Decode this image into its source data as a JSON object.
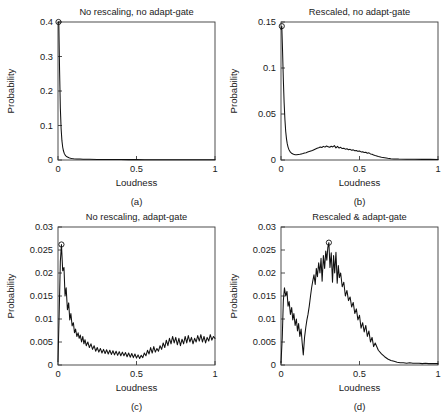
{
  "figure": {
    "width": 447,
    "height": 413,
    "background": "#ffffff",
    "line_color": "#111111",
    "axis_color": "#3b3b3b"
  },
  "panels": [
    {
      "id": "a",
      "caption": "(a)",
      "title": "No rescaling, no adapt-gate",
      "xlabel": "Loudness",
      "ylabel": "Probability",
      "xticks": [
        0,
        0.5,
        1
      ],
      "xticklabels": [
        "0",
        "0.5",
        "1"
      ],
      "yticks": [
        0,
        0.1,
        0.2,
        0.3,
        0.4
      ],
      "yticklabels": [
        "0",
        "0.1",
        "0.2",
        "0.3",
        "0.4"
      ],
      "xlim": [
        0,
        1
      ],
      "ylim": [
        0,
        0.4
      ],
      "peak_marker": {
        "x": 0.003,
        "y": 0.4
      }
    },
    {
      "id": "b",
      "caption": "(b)",
      "title": "Rescaled, no adapt-gate",
      "xlabel": "Loudness",
      "ylabel": "Probability",
      "xticks": [
        0,
        0.5,
        1
      ],
      "xticklabels": [
        "0",
        "0.5",
        "1"
      ],
      "yticks": [
        0,
        0.05,
        0.1,
        0.15
      ],
      "yticklabels": [
        "0",
        "0.05",
        "0.1",
        "0.15"
      ],
      "xlim": [
        0,
        1
      ],
      "ylim": [
        0,
        0.15
      ],
      "peak_marker": {
        "x": 0.005,
        "y": 0.1455
      }
    },
    {
      "id": "c",
      "caption": "(c)",
      "title": "No rescaling, adapt-gate",
      "xlabel": "Loudness",
      "ylabel": "Probability",
      "xticks": [
        0,
        0.5,
        1
      ],
      "xticklabels": [
        "0",
        "0.5",
        "1"
      ],
      "yticks": [
        0,
        0.005,
        0.01,
        0.015,
        0.02,
        0.025,
        0.03
      ],
      "yticklabels": [
        "0",
        "0.005",
        "0.01",
        "0.015",
        "0.02",
        "0.025",
        "0.03"
      ],
      "xlim": [
        0,
        1
      ],
      "ylim": [
        0,
        0.03
      ],
      "peak_marker": {
        "x": 0.022,
        "y": 0.0262
      }
    },
    {
      "id": "d",
      "caption": "(d)",
      "title": "Rescaled & adapt-gate",
      "xlabel": "Loudness",
      "ylabel": "Probability",
      "xticks": [
        0,
        0.5,
        1
      ],
      "xticklabels": [
        "0",
        "0.5",
        "1"
      ],
      "yticks": [
        0,
        0.005,
        0.01,
        0.015,
        0.02,
        0.025,
        0.03
      ],
      "yticklabels": [
        "0",
        "0.005",
        "0.01",
        "0.015",
        "0.02",
        "0.025",
        "0.03"
      ],
      "xlim": [
        0,
        1
      ],
      "ylim": [
        0,
        0.03
      ],
      "peak_marker": {
        "x": 0.305,
        "y": 0.0266
      }
    }
  ],
  "chart_data": [
    {
      "type": "line",
      "panel": "a",
      "title": "No rescaling, no adapt-gate",
      "xlabel": "Loudness",
      "ylabel": "Probability",
      "xlim": [
        0,
        1
      ],
      "ylim": [
        0,
        0.4
      ],
      "grid": false,
      "legend": null,
      "annotations": [
        "peak marker circle at (0.003, 0.4)"
      ],
      "x": [
        0.0,
        0.005,
        0.01,
        0.015,
        0.02,
        0.025,
        0.03,
        0.035,
        0.04,
        0.045,
        0.05,
        0.055,
        0.06,
        0.07,
        0.08,
        0.09,
        0.1,
        0.12,
        0.14,
        0.16,
        0.18,
        0.2,
        0.25,
        0.3,
        0.35,
        0.4,
        0.45,
        0.5,
        0.55,
        0.6,
        0.65,
        0.7,
        0.75,
        0.8,
        0.85,
        0.9,
        0.95,
        1.0
      ],
      "y": [
        0.398,
        0.4,
        0.26,
        0.15,
        0.09,
        0.056,
        0.037,
        0.026,
        0.019,
        0.015,
        0.012,
        0.01,
        0.0085,
        0.0065,
        0.0052,
        0.0044,
        0.0038,
        0.003,
        0.0026,
        0.0023,
        0.0021,
        0.0019,
        0.0016,
        0.0014,
        0.0013,
        0.0012,
        0.0011,
        0.0011,
        0.001,
        0.001,
        0.0009,
        0.0009,
        0.0009,
        0.0008,
        0.0008,
        0.0008,
        0.0007,
        0.0007
      ]
    },
    {
      "type": "line",
      "panel": "b",
      "title": "Rescaled, no adapt-gate",
      "xlabel": "Loudness",
      "ylabel": "Probability",
      "xlim": [
        0,
        1
      ],
      "ylim": [
        0,
        0.15
      ],
      "grid": false,
      "legend": null,
      "annotations": [
        "peak marker circle at (0.005, 0.1455)"
      ],
      "x": [
        0.0,
        0.005,
        0.01,
        0.015,
        0.02,
        0.025,
        0.03,
        0.035,
        0.04,
        0.045,
        0.05,
        0.06,
        0.07,
        0.08,
        0.09,
        0.1,
        0.11,
        0.12,
        0.13,
        0.14,
        0.15,
        0.16,
        0.17,
        0.18,
        0.19,
        0.2,
        0.21,
        0.22,
        0.23,
        0.24,
        0.25,
        0.26,
        0.27,
        0.28,
        0.29,
        0.3,
        0.31,
        0.32,
        0.33,
        0.34,
        0.35,
        0.36,
        0.37,
        0.38,
        0.39,
        0.4,
        0.41,
        0.42,
        0.43,
        0.44,
        0.45,
        0.46,
        0.47,
        0.48,
        0.49,
        0.5,
        0.51,
        0.52,
        0.53,
        0.54,
        0.55,
        0.56,
        0.57,
        0.58,
        0.59,
        0.6,
        0.62,
        0.64,
        0.66,
        0.68,
        0.7,
        0.72,
        0.75,
        0.8,
        0.85,
        0.9,
        0.95,
        1.0
      ],
      "y": [
        0.142,
        0.1455,
        0.118,
        0.087,
        0.062,
        0.044,
        0.031,
        0.023,
        0.0175,
        0.014,
        0.0115,
        0.0085,
        0.007,
        0.0062,
        0.0058,
        0.0058,
        0.006,
        0.0062,
        0.0066,
        0.007,
        0.0075,
        0.008,
        0.0086,
        0.0092,
        0.0098,
        0.0104,
        0.0112,
        0.012,
        0.0128,
        0.0134,
        0.0142,
        0.0136,
        0.0148,
        0.014,
        0.0152,
        0.0145,
        0.0138,
        0.015,
        0.0142,
        0.0156,
        0.0132,
        0.0148,
        0.013,
        0.0138,
        0.0124,
        0.0128,
        0.0118,
        0.0122,
        0.0112,
        0.0116,
        0.0106,
        0.011,
        0.01,
        0.0104,
        0.0094,
        0.0098,
        0.0088,
        0.009,
        0.0082,
        0.0084,
        0.0074,
        0.0078,
        0.0066,
        0.0062,
        0.0054,
        0.0048,
        0.0038,
        0.003,
        0.0024,
        0.0018,
        0.0014,
        0.0012,
        0.001,
        0.0009,
        0.0008,
        0.0007,
        0.0007,
        0.0006
      ]
    },
    {
      "type": "line",
      "panel": "c",
      "title": "No rescaling, adapt-gate",
      "xlabel": "Loudness",
      "ylabel": "Probability",
      "xlim": [
        0,
        1
      ],
      "ylim": [
        0,
        0.03
      ],
      "grid": false,
      "legend": null,
      "annotations": [
        "peak marker circle at (0.022, 0.0262)"
      ],
      "x": [
        0.0,
        0.008,
        0.015,
        0.022,
        0.03,
        0.038,
        0.045,
        0.052,
        0.06,
        0.068,
        0.075,
        0.082,
        0.09,
        0.098,
        0.105,
        0.112,
        0.12,
        0.128,
        0.135,
        0.142,
        0.15,
        0.158,
        0.165,
        0.172,
        0.18,
        0.19,
        0.2,
        0.21,
        0.22,
        0.23,
        0.24,
        0.25,
        0.26,
        0.27,
        0.28,
        0.29,
        0.3,
        0.31,
        0.32,
        0.33,
        0.34,
        0.35,
        0.36,
        0.37,
        0.38,
        0.39,
        0.4,
        0.41,
        0.42,
        0.43,
        0.44,
        0.45,
        0.46,
        0.47,
        0.48,
        0.49,
        0.5,
        0.51,
        0.52,
        0.53,
        0.54,
        0.55,
        0.56,
        0.57,
        0.58,
        0.59,
        0.6,
        0.61,
        0.62,
        0.63,
        0.64,
        0.65,
        0.66,
        0.67,
        0.68,
        0.69,
        0.7,
        0.71,
        0.72,
        0.73,
        0.74,
        0.75,
        0.76,
        0.77,
        0.78,
        0.79,
        0.8,
        0.81,
        0.82,
        0.83,
        0.84,
        0.85,
        0.86,
        0.87,
        0.88,
        0.89,
        0.9,
        0.91,
        0.92,
        0.93,
        0.94,
        0.95,
        0.96,
        0.97,
        0.98,
        0.99,
        1.0
      ],
      "y": [
        0.0008,
        0.012,
        0.0225,
        0.0262,
        0.0205,
        0.0212,
        0.015,
        0.0168,
        0.012,
        0.0135,
        0.0098,
        0.0112,
        0.0085,
        0.0092,
        0.007,
        0.0078,
        0.0062,
        0.007,
        0.0058,
        0.0065,
        0.005,
        0.0062,
        0.0046,
        0.0055,
        0.0042,
        0.005,
        0.0038,
        0.0046,
        0.0034,
        0.0042,
        0.003,
        0.0038,
        0.0028,
        0.0036,
        0.0026,
        0.0034,
        0.0025,
        0.0033,
        0.0024,
        0.0032,
        0.0023,
        0.0031,
        0.0022,
        0.003,
        0.0021,
        0.0029,
        0.002,
        0.0028,
        0.002,
        0.0027,
        0.0018,
        0.0026,
        0.0017,
        0.0025,
        0.0016,
        0.0024,
        0.0015,
        0.0022,
        0.0014,
        0.0021,
        0.0016,
        0.0026,
        0.002,
        0.0032,
        0.0024,
        0.0038,
        0.0026,
        0.004,
        0.0028,
        0.0036,
        0.003,
        0.0042,
        0.0034,
        0.0048,
        0.0038,
        0.0054,
        0.0042,
        0.0058,
        0.0046,
        0.0062,
        0.0048,
        0.006,
        0.0044,
        0.0058,
        0.0042,
        0.0056,
        0.0046,
        0.0062,
        0.0048,
        0.0064,
        0.005,
        0.006,
        0.0046,
        0.0058,
        0.005,
        0.0064,
        0.0052,
        0.0066,
        0.005,
        0.0062,
        0.0048,
        0.006,
        0.0052,
        0.0066,
        0.0054,
        0.0062,
        0.0058
      ]
    },
    {
      "type": "line",
      "panel": "d",
      "title": "Rescaled & adapt-gate",
      "xlabel": "Loudness",
      "ylabel": "Probability",
      "xlim": [
        0,
        1
      ],
      "ylim": [
        0,
        0.03
      ],
      "grid": false,
      "legend": null,
      "annotations": [
        "peak marker circle at (0.305, 0.0266)"
      ],
      "x": [
        0.0,
        0.008,
        0.015,
        0.022,
        0.03,
        0.038,
        0.045,
        0.052,
        0.06,
        0.068,
        0.075,
        0.082,
        0.09,
        0.098,
        0.105,
        0.112,
        0.12,
        0.128,
        0.135,
        0.142,
        0.15,
        0.158,
        0.165,
        0.172,
        0.18,
        0.188,
        0.195,
        0.202,
        0.21,
        0.218,
        0.225,
        0.232,
        0.24,
        0.248,
        0.255,
        0.262,
        0.27,
        0.278,
        0.285,
        0.292,
        0.298,
        0.305,
        0.312,
        0.32,
        0.328,
        0.335,
        0.342,
        0.35,
        0.358,
        0.365,
        0.372,
        0.38,
        0.39,
        0.4,
        0.41,
        0.42,
        0.43,
        0.44,
        0.45,
        0.46,
        0.47,
        0.48,
        0.49,
        0.5,
        0.51,
        0.52,
        0.53,
        0.54,
        0.55,
        0.56,
        0.57,
        0.58,
        0.59,
        0.6,
        0.62,
        0.64,
        0.66,
        0.68,
        0.7,
        0.72,
        0.74,
        0.76,
        0.78,
        0.8,
        0.82,
        0.84,
        0.86,
        0.88,
        0.9,
        0.92,
        0.94,
        0.96,
        0.98,
        1.0
      ],
      "y": [
        0.0005,
        0.006,
        0.014,
        0.0168,
        0.015,
        0.016,
        0.0128,
        0.0138,
        0.011,
        0.0125,
        0.0098,
        0.0112,
        0.0086,
        0.01,
        0.0074,
        0.009,
        0.0062,
        0.0078,
        0.0048,
        0.0022,
        0.006,
        0.0082,
        0.0098,
        0.011,
        0.0128,
        0.015,
        0.0168,
        0.0182,
        0.0196,
        0.0175,
        0.021,
        0.0192,
        0.0222,
        0.02,
        0.0232,
        0.0182,
        0.0238,
        0.021,
        0.0248,
        0.0228,
        0.0255,
        0.0266,
        0.0212,
        0.0244,
        0.018,
        0.0238,
        0.02,
        0.0245,
        0.0178,
        0.0216,
        0.019,
        0.02,
        0.017,
        0.018,
        0.015,
        0.0162,
        0.014,
        0.0148,
        0.0126,
        0.0136,
        0.0112,
        0.0122,
        0.0098,
        0.0108,
        0.008,
        0.0092,
        0.0072,
        0.0086,
        0.0062,
        0.0074,
        0.005,
        0.006,
        0.004,
        0.0048,
        0.0032,
        0.0024,
        0.0018,
        0.0013,
        0.001,
        0.0008,
        0.0006,
        0.0005,
        0.0005,
        0.0004,
        0.0005,
        0.0004,
        0.0004,
        0.0004,
        0.0003,
        0.0004,
        0.0003,
        0.0003,
        0.0003,
        0.0003
      ]
    }
  ]
}
